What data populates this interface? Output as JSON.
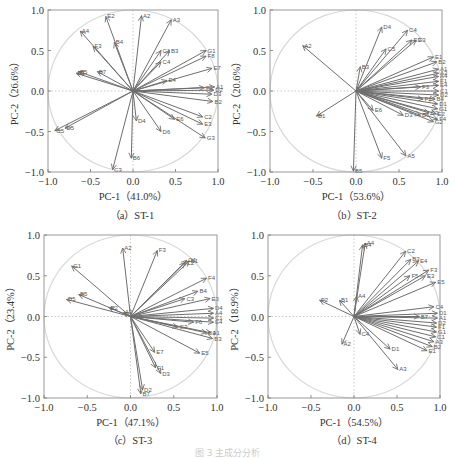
{
  "figure": {
    "caption": "图 3  主成分分析"
  },
  "chart_data": [
    {
      "type": "scatter",
      "subtype": "pca-loading-plot",
      "panel": "a",
      "title": "（a）ST-1",
      "xlabel": "PC-1（41.0%）",
      "ylabel": "PC-2（26.6%）",
      "xlim": [
        -1.0,
        1.0
      ],
      "ylim": [
        -1.0,
        1.0
      ],
      "xticks": [
        "-1.0",
        "-0.5",
        "0.0",
        "0.5",
        "1.0"
      ],
      "yticks": [
        "1.0",
        "0.5",
        "0.0",
        "-0.5",
        "-1.0"
      ],
      "unit_circle": true,
      "vectors": [
        {
          "label": "E2",
          "x": -0.32,
          "y": 0.92
        },
        {
          "label": "A2",
          "x": 0.1,
          "y": 0.93
        },
        {
          "label": "A3",
          "x": 0.45,
          "y": 0.88
        },
        {
          "label": "A4",
          "x": -0.62,
          "y": 0.74
        },
        {
          "label": "B4",
          "x": -0.22,
          "y": 0.6
        },
        {
          "label": "F3",
          "x": -0.47,
          "y": 0.55
        },
        {
          "label": "C1",
          "x": 0.33,
          "y": 0.5
        },
        {
          "label": "B3",
          "x": 0.43,
          "y": 0.5
        },
        {
          "label": "C4",
          "x": 0.33,
          "y": 0.36
        },
        {
          "label": "G1",
          "x": 0.86,
          "y": 0.5
        },
        {
          "label": "F8",
          "x": 0.86,
          "y": 0.43
        },
        {
          "label": "B5",
          "x": -0.64,
          "y": 0.24
        },
        {
          "label": "E1",
          "x": -0.67,
          "y": 0.22
        },
        {
          "label": "B7",
          "x": -0.42,
          "y": 0.24
        },
        {
          "label": "E7",
          "x": 0.93,
          "y": 0.28
        },
        {
          "label": "E4",
          "x": 0.4,
          "y": 0.13
        },
        {
          "label": "F1",
          "x": 0.84,
          "y": 0.04
        },
        {
          "label": "A1",
          "x": 0.96,
          "y": 0.05
        },
        {
          "label": "D2",
          "x": 0.95,
          "y": 0.01
        },
        {
          "label": "D3",
          "x": 0.93,
          "y": -0.04
        },
        {
          "label": "B2",
          "x": 0.94,
          "y": -0.13
        },
        {
          "label": "C2",
          "x": 0.82,
          "y": -0.32
        },
        {
          "label": "E3",
          "x": 0.82,
          "y": -0.41
        },
        {
          "label": "G3",
          "x": 0.85,
          "y": -0.58
        },
        {
          "label": "E6",
          "x": 0.49,
          "y": -0.35
        },
        {
          "label": "D6",
          "x": 0.33,
          "y": -0.5
        },
        {
          "label": "D4",
          "x": 0.04,
          "y": -0.37
        },
        {
          "label": "D5",
          "x": -0.8,
          "y": -0.46
        },
        {
          "label": "C5",
          "x": -0.92,
          "y": -0.49
        },
        {
          "label": "B6",
          "x": -0.02,
          "y": -0.83
        },
        {
          "label": "C3",
          "x": -0.24,
          "y": -0.97
        }
      ]
    },
    {
      "type": "scatter",
      "subtype": "pca-loading-plot",
      "panel": "b",
      "title": "（b）ST-2",
      "xlabel": "PC-1（53.6%）",
      "ylabel": "PC-2（20.6%）",
      "xlim": [
        -1.0,
        1.0
      ],
      "ylim": [
        -1.0,
        1.0
      ],
      "xticks": [
        "-1.0",
        "-0.5",
        "0.0",
        "0.5",
        "1.0"
      ],
      "yticks": [
        "1.0",
        "0.5",
        "0.0",
        "-0.5",
        "-1.0"
      ],
      "unit_circle": true,
      "vectors": [
        {
          "label": "A2",
          "x": -0.62,
          "y": 0.56
        },
        {
          "label": "D4",
          "x": 0.3,
          "y": 0.79
        },
        {
          "label": "C4",
          "x": 0.6,
          "y": 0.75
        },
        {
          "label": "E3",
          "x": 0.65,
          "y": 0.63
        },
        {
          "label": "G3",
          "x": 0.7,
          "y": 0.63
        },
        {
          "label": "C5",
          "x": 0.35,
          "y": 0.52
        },
        {
          "label": "E1",
          "x": 0.9,
          "y": 0.42
        },
        {
          "label": "B2",
          "x": 0.94,
          "y": 0.36
        },
        {
          "label": "B3",
          "x": 0.05,
          "y": 0.3
        },
        {
          "label": "A1",
          "x": 0.96,
          "y": 0.27
        },
        {
          "label": "A3",
          "x": 0.96,
          "y": 0.22
        },
        {
          "label": "A4",
          "x": 0.96,
          "y": 0.18
        },
        {
          "label": "F1",
          "x": 0.96,
          "y": 0.12
        },
        {
          "label": "E4",
          "x": 0.96,
          "y": 0.07
        },
        {
          "label": "F3",
          "x": 0.75,
          "y": 0.05
        },
        {
          "label": "C1",
          "x": 0.96,
          "y": 0.0
        },
        {
          "label": "D2",
          "x": 0.96,
          "y": -0.05
        },
        {
          "label": "B4",
          "x": 0.92,
          "y": -0.1
        },
        {
          "label": "F2",
          "x": 0.78,
          "y": -0.1
        },
        {
          "label": "D1",
          "x": 0.95,
          "y": -0.16
        },
        {
          "label": "G1",
          "x": 0.95,
          "y": -0.22
        },
        {
          "label": "E2",
          "x": 0.93,
          "y": -0.28
        },
        {
          "label": "C3",
          "x": 0.85,
          "y": -0.27
        },
        {
          "label": "B6",
          "x": 0.75,
          "y": -0.3
        },
        {
          "label": "D3",
          "x": 0.55,
          "y": -0.3
        },
        {
          "label": "F4",
          "x": 0.95,
          "y": -0.35
        },
        {
          "label": "G2",
          "x": 0.9,
          "y": -0.38
        },
        {
          "label": "E6",
          "x": 0.2,
          "y": -0.24
        },
        {
          "label": "B1",
          "x": -0.46,
          "y": -0.31
        },
        {
          "label": "F5",
          "x": 0.3,
          "y": -0.83
        },
        {
          "label": "A5",
          "x": 0.58,
          "y": -0.8
        },
        {
          "label": "B5",
          "x": -0.03,
          "y": -0.99
        }
      ]
    },
    {
      "type": "scatter",
      "subtype": "pca-loading-plot",
      "panel": "c",
      "title": "（c）ST-3",
      "xlabel": "PC-1（47.1%）",
      "ylabel": "PC-2（23.4%）",
      "xlim": [
        -1.0,
        1.0
      ],
      "ylim": [
        -1.0,
        1.0
      ],
      "xticks": [
        "-1.0",
        "-0.5",
        "0.0",
        "0.5",
        "1.0"
      ],
      "yticks": [
        "1.0",
        "0.5",
        "0.0",
        "-0.5",
        "-1.0"
      ],
      "unit_circle": true,
      "vectors": [
        {
          "label": "A2",
          "x": -0.09,
          "y": 0.84
        },
        {
          "label": "F3",
          "x": 0.31,
          "y": 0.81
        },
        {
          "label": "G1",
          "x": 0.65,
          "y": 0.69
        },
        {
          "label": "B1",
          "x": 0.68,
          "y": 0.68
        },
        {
          "label": "C2",
          "x": 0.63,
          "y": 0.66
        },
        {
          "label": "G1",
          "x": -0.68,
          "y": 0.62
        },
        {
          "label": "F4",
          "x": 0.88,
          "y": 0.47
        },
        {
          "label": "B4",
          "x": 0.78,
          "y": 0.31
        },
        {
          "label": "C3",
          "x": 0.63,
          "y": 0.22
        },
        {
          "label": "E3",
          "x": 0.92,
          "y": 0.22
        },
        {
          "label": "B5",
          "x": -0.6,
          "y": 0.27
        },
        {
          "label": "D5",
          "x": -0.74,
          "y": 0.21
        },
        {
          "label": "E2",
          "x": -0.25,
          "y": 0.11
        },
        {
          "label": "A3",
          "x": -0.08,
          "y": 0.05
        },
        {
          "label": "D4",
          "x": 0.96,
          "y": 0.1
        },
        {
          "label": "A4",
          "x": 0.96,
          "y": 0.04
        },
        {
          "label": "C1",
          "x": 0.96,
          "y": -0.02
        },
        {
          "label": "E4",
          "x": 0.96,
          "y": -0.07
        },
        {
          "label": "F6",
          "x": 0.73,
          "y": -0.07
        },
        {
          "label": "G3",
          "x": 0.55,
          "y": -0.13
        },
        {
          "label": "A1",
          "x": 0.93,
          "y": -0.2
        },
        {
          "label": "D1",
          "x": 0.88,
          "y": -0.2
        },
        {
          "label": "B3",
          "x": 0.95,
          "y": -0.27
        },
        {
          "label": "E5",
          "x": 0.8,
          "y": -0.45
        },
        {
          "label": "E7",
          "x": 0.28,
          "y": -0.44
        },
        {
          "label": "F1",
          "x": 0.29,
          "y": -0.63
        },
        {
          "label": "D3",
          "x": 0.35,
          "y": -0.7
        },
        {
          "label": "D2",
          "x": 0.14,
          "y": -0.9
        },
        {
          "label": "B7",
          "x": 0.12,
          "y": -0.95
        }
      ]
    },
    {
      "type": "scatter",
      "subtype": "pca-loading-plot",
      "panel": "d",
      "title": "（d）ST-4",
      "xlabel": "PC-1（54.5%）",
      "ylabel": "PC-2（18.9%）",
      "xlim": [
        -1.0,
        1.0
      ],
      "ylim": [
        -1.0,
        1.0
      ],
      "xticks": [
        "-1.0",
        "-0.5",
        "0.0",
        "0.5",
        "1.0"
      ],
      "yticks": [
        "1.0",
        "0.5",
        "0.0",
        "-0.5",
        "-1.0"
      ],
      "unit_circle": true,
      "vectors": [
        {
          "label": "A4",
          "x": 0.13,
          "y": 0.9
        },
        {
          "label": "B4",
          "x": 0.1,
          "y": 0.88
        },
        {
          "label": "C2",
          "x": 0.6,
          "y": 0.8
        },
        {
          "label": "B3",
          "x": 0.66,
          "y": 0.7
        },
        {
          "label": "E4",
          "x": 0.75,
          "y": 0.68
        },
        {
          "label": "F3",
          "x": 0.87,
          "y": 0.57
        },
        {
          "label": "F5",
          "x": 0.65,
          "y": 0.5
        },
        {
          "label": "E3",
          "x": 0.83,
          "y": 0.5
        },
        {
          "label": "E5",
          "x": 0.95,
          "y": 0.42
        },
        {
          "label": "A4",
          "x": 0.03,
          "y": 0.25
        },
        {
          "label": "F2",
          "x": -0.4,
          "y": 0.2
        },
        {
          "label": "B1",
          "x": -0.17,
          "y": 0.2
        },
        {
          "label": "C4",
          "x": 0.93,
          "y": 0.12
        },
        {
          "label": "B7",
          "x": 0.76,
          "y": 0.0
        },
        {
          "label": "D1",
          "x": 0.97,
          "y": 0.04
        },
        {
          "label": "A1",
          "x": 0.97,
          "y": -0.02
        },
        {
          "label": "D2",
          "x": 0.96,
          "y": -0.08
        },
        {
          "label": "F1",
          "x": 0.96,
          "y": -0.13
        },
        {
          "label": "G1",
          "x": 0.96,
          "y": -0.19
        },
        {
          "label": "C1",
          "x": 0.95,
          "y": -0.25
        },
        {
          "label": "A3",
          "x": 0.93,
          "y": -0.31
        },
        {
          "label": "B2",
          "x": 0.91,
          "y": -0.37
        },
        {
          "label": "E1",
          "x": 0.85,
          "y": -0.42
        },
        {
          "label": "C4",
          "x": 0.07,
          "y": -0.22
        },
        {
          "label": "A2",
          "x": -0.14,
          "y": -0.34
        },
        {
          "label": "D1",
          "x": 0.42,
          "y": -0.4
        },
        {
          "label": "A3",
          "x": 0.51,
          "y": -0.65
        }
      ]
    }
  ]
}
